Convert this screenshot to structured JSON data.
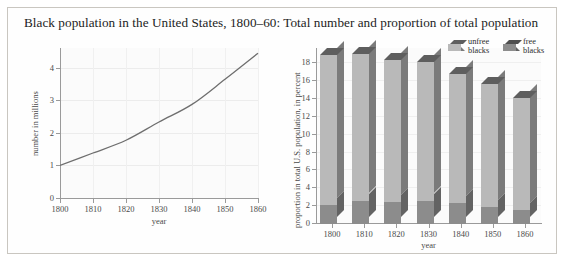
{
  "caption": "Black population in the United States, 1800–60: Total number and proportion of total population",
  "colors": {
    "unfree_front": "#b9b9b9",
    "unfree_side": "#7b7b7b",
    "unfree_top": "#5e5e5e",
    "free_front": "#8c8c8c",
    "free_side": "#636363",
    "line": "#6e6e6e",
    "border": "#c9c6c0",
    "plot_bg": "#fbfbfb",
    "grid": "#ececec",
    "axis": "#9a9a9a"
  },
  "chart_data": [
    {
      "type": "line",
      "id": "total-number",
      "title": "",
      "xlabel": "year",
      "ylabel": "number in millions",
      "x": [
        1800,
        1810,
        1820,
        1830,
        1840,
        1850,
        1860
      ],
      "values": [
        1.0,
        1.38,
        1.77,
        2.33,
        2.87,
        3.64,
        4.44
      ],
      "xticks": [
        "1800",
        "1810",
        "1820",
        "1830",
        "1840",
        "1850",
        "1860"
      ],
      "yticks": [
        "0",
        "1",
        "2",
        "3",
        "4"
      ],
      "xlim": [
        1800,
        1860
      ],
      "ylim": [
        0,
        4.6
      ],
      "grid": true,
      "legend": "none"
    },
    {
      "type": "bar",
      "id": "proportion-of-total-population",
      "subtype": "stacked-3d",
      "title": "",
      "xlabel": "year",
      "ylabel": "proportion in total U.S. population, in percent",
      "categories": [
        "1800",
        "1810",
        "1820",
        "1830",
        "1840",
        "1850",
        "1860"
      ],
      "series": [
        {
          "name": "free blacks",
          "values": [
            2.1,
            2.6,
            2.5,
            2.6,
            2.3,
            1.9,
            1.6
          ]
        },
        {
          "name": "unfree blacks",
          "values": [
            16.8,
            16.4,
            15.9,
            15.5,
            14.5,
            13.8,
            12.5
          ]
        }
      ],
      "totals": [
        18.9,
        19.0,
        18.4,
        18.1,
        16.8,
        15.7,
        14.1
      ],
      "yticks": [
        "0",
        "2",
        "4",
        "6",
        "8",
        "10",
        "12",
        "14",
        "16",
        "18"
      ],
      "ylim": [
        0,
        19.6
      ],
      "grid": true,
      "legend": {
        "position": "top-right",
        "entries": [
          "unfree blacks",
          "free blacks"
        ]
      }
    }
  ],
  "legend": {
    "unfree_line1": "unfree",
    "unfree_line2": "blacks",
    "free_line1": "free",
    "free_line2": "blacks"
  }
}
